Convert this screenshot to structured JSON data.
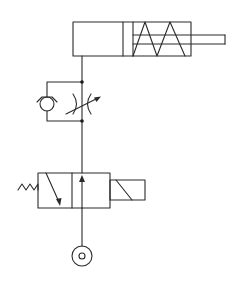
{
  "diagram": {
    "type": "pneumatic-circuit",
    "title": "Single-acting spring-return cylinder circuit with one-way flow control and solenoid 3/2 valve",
    "components": [
      {
        "id": "cylinder",
        "label": "Single-acting cylinder, spring return",
        "symbol": "cylinder-spring-return"
      },
      {
        "id": "flow_control",
        "label": "One-way flow control valve",
        "symbol": "throttle-check-valve"
      },
      {
        "id": "check_valve",
        "label": "Check valve (bypass)",
        "symbol": "check-valve"
      },
      {
        "id": "throttle",
        "label": "Adjustable throttle",
        "symbol": "variable-restrictor"
      },
      {
        "id": "directional_valve",
        "label": "3/2 directional valve, solenoid actuated, spring return",
        "symbol": "directional-valve-3-2"
      },
      {
        "id": "solenoid",
        "label": "Solenoid actuator",
        "symbol": "solenoid"
      },
      {
        "id": "spring",
        "label": "Return spring",
        "symbol": "spring"
      },
      {
        "id": "pressure_source",
        "label": "Pressure source",
        "symbol": "pressure-source"
      }
    ],
    "connections": [
      {
        "from": "pressure_source",
        "to": "directional_valve"
      },
      {
        "from": "directional_valve",
        "to": "flow_control"
      },
      {
        "from": "flow_control",
        "to": "cylinder"
      }
    ],
    "colors": {
      "line": "#2a2a2a",
      "background": "#ffffff"
    }
  }
}
